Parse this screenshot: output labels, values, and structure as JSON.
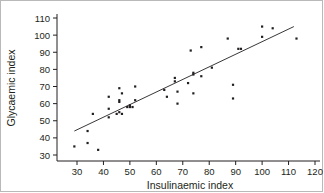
{
  "chart_data": {
    "type": "scatter",
    "title": "",
    "xlabel": "Insulinaemic index",
    "ylabel": "Glycaemic index",
    "xlim": [
      25,
      122
    ],
    "ylim": [
      28,
      112
    ],
    "xticks": [
      30,
      40,
      50,
      60,
      70,
      80,
      90,
      100,
      110,
      120
    ],
    "yticks": [
      30,
      40,
      50,
      60,
      70,
      80,
      90,
      100,
      110
    ],
    "grid": false,
    "legend": null,
    "marker": "square-dot",
    "marker_color": "#231f20",
    "axis_color": "#231f20",
    "points": [
      [
        29,
        35
      ],
      [
        34,
        44
      ],
      [
        34,
        37
      ],
      [
        36,
        54
      ],
      [
        38,
        33
      ],
      [
        42,
        64
      ],
      [
        42,
        57
      ],
      [
        42,
        52
      ],
      [
        45,
        54
      ],
      [
        46,
        69
      ],
      [
        46,
        62
      ],
      [
        46,
        61
      ],
      [
        46,
        55
      ],
      [
        47,
        66
      ],
      [
        47,
        54
      ],
      [
        49,
        58
      ],
      [
        50,
        58
      ],
      [
        50,
        59
      ],
      [
        51,
        58
      ],
      [
        52,
        70
      ],
      [
        52,
        62
      ],
      [
        63,
        68
      ],
      [
        64,
        64
      ],
      [
        67,
        75
      ],
      [
        67,
        73
      ],
      [
        68,
        67
      ],
      [
        68,
        60
      ],
      [
        72,
        72
      ],
      [
        73,
        91
      ],
      [
        74,
        78
      ],
      [
        74,
        77
      ],
      [
        74,
        66
      ],
      [
        77,
        93
      ],
      [
        77,
        76
      ],
      [
        81,
        81
      ],
      [
        87,
        98
      ],
      [
        89,
        71
      ],
      [
        89,
        63
      ],
      [
        91,
        92
      ],
      [
        92,
        92
      ],
      [
        100,
        105
      ],
      [
        100,
        99
      ],
      [
        104,
        104
      ],
      [
        113,
        98
      ]
    ],
    "fit_line": {
      "x_start": 29,
      "y_start": 44,
      "x_end": 112,
      "y_end": 105,
      "style": "solid"
    }
  }
}
